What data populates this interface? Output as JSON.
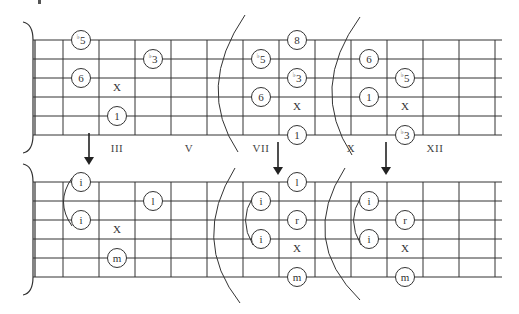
{
  "diagram": {
    "colors": {
      "line": "#333333",
      "background": "#ffffff",
      "text": "#333333"
    },
    "geometry": {
      "nut_x": 33,
      "fret_spacing": 36,
      "fret_count": 13,
      "string_spacing": 19,
      "string_end_x": 502,
      "top_first_string_y": 40,
      "bottom_first_string_y": 182
    },
    "position_labels": [
      {
        "text": "III",
        "x": 117,
        "y": 150
      },
      {
        "text": "V",
        "x": 189,
        "y": 150
      },
      {
        "text": "VII",
        "x": 261,
        "y": 150
      },
      {
        "text": "X",
        "x": 351,
        "y": 150
      },
      {
        "text": "XII",
        "x": 435,
        "y": 150
      }
    ],
    "arrows": [
      {
        "x": 89,
        "y1": 133,
        "y2": 165
      },
      {
        "x": 278,
        "y1": 142,
        "y2": 175
      },
      {
        "x": 386,
        "y1": 142,
        "y2": 175
      }
    ],
    "top_diagram": {
      "name": "scale-degrees",
      "notes": [
        {
          "label": "5",
          "flat": true,
          "fret_x": 81,
          "string": 0
        },
        {
          "label": "3",
          "flat": true,
          "fret_x": 153,
          "string": 1
        },
        {
          "label": "6",
          "flat": false,
          "fret_x": 81,
          "string": 2
        },
        {
          "label": "1",
          "flat": false,
          "fret_x": 117,
          "string": 4
        },
        {
          "label": "8",
          "flat": false,
          "fret_x": 297,
          "string": 0
        },
        {
          "label": "5",
          "flat": true,
          "fret_x": 261,
          "string": 1
        },
        {
          "label": "3",
          "flat": true,
          "fret_x": 297,
          "string": 2
        },
        {
          "label": "6",
          "flat": false,
          "fret_x": 261,
          "string": 3
        },
        {
          "label": "1",
          "flat": false,
          "fret_x": 297,
          "string": 5
        },
        {
          "label": "6",
          "flat": false,
          "fret_x": 369,
          "string": 1
        },
        {
          "label": "5",
          "flat": true,
          "fret_x": 405,
          "string": 2
        },
        {
          "label": "1",
          "flat": false,
          "fret_x": 369,
          "string": 3
        },
        {
          "label": "3",
          "flat": true,
          "fret_x": 405,
          "string": 5
        }
      ],
      "muted": [
        {
          "label": "X",
          "x": 117,
          "y": 97
        },
        {
          "label": "X",
          "x": 297,
          "y": 116
        },
        {
          "label": "X",
          "x": 405,
          "y": 116
        }
      ],
      "arcs": [
        {
          "d": "M245 15 Q195 88 238 152"
        },
        {
          "d": "M360 17 Q308 88 352 155"
        }
      ]
    },
    "bottom_diagram": {
      "name": "fingerings",
      "notes": [
        {
          "label": "i",
          "fret_x": 81,
          "string": 0
        },
        {
          "label": "i",
          "fret_x": 81,
          "string": 2
        },
        {
          "label": "l",
          "fret_x": 153,
          "string": 1
        },
        {
          "label": "m",
          "fret_x": 117,
          "string": 4
        },
        {
          "label": "l",
          "fret_x": 297,
          "string": 0
        },
        {
          "label": "i",
          "fret_x": 261,
          "string": 1
        },
        {
          "label": "r",
          "fret_x": 297,
          "string": 2
        },
        {
          "label": "i",
          "fret_x": 261,
          "string": 3
        },
        {
          "label": "m",
          "fret_x": 297,
          "string": 5
        },
        {
          "label": "i",
          "fret_x": 369,
          "string": 1
        },
        {
          "label": "r",
          "fret_x": 405,
          "string": 2
        },
        {
          "label": "i",
          "fret_x": 369,
          "string": 3
        },
        {
          "label": "m",
          "fret_x": 405,
          "string": 5
        }
      ],
      "muted": [
        {
          "label": "X",
          "x": 117,
          "y": 239
        },
        {
          "label": "X",
          "x": 297,
          "y": 258
        },
        {
          "label": "X",
          "x": 405,
          "y": 258
        }
      ],
      "arcs": [
        {
          "d": "M235 168 Q190 240 240 303"
        },
        {
          "d": "M345 168 Q298 240 360 300"
        }
      ],
      "barres": [
        {
          "d": "M72 178 Q55 202 72 226"
        },
        {
          "d": "M253 197 Q238 220 253 245"
        },
        {
          "d": "M361 197 Q346 220 361 245"
        }
      ]
    }
  }
}
